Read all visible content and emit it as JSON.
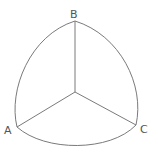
{
  "diagram": {
    "type": "spherical-triangle",
    "colors": {
      "stroke": "#7a7a7a",
      "label": "#555555",
      "background": "#ffffff"
    },
    "vertices": [
      {
        "id": "A",
        "label": "A",
        "x": 17,
        "y": 127
      },
      {
        "id": "B",
        "label": "B",
        "x": 75,
        "y": 21
      },
      {
        "id": "C",
        "label": "C",
        "x": 136,
        "y": 125
      }
    ],
    "center": {
      "x": 75,
      "y": 92
    },
    "edges": [
      {
        "from": "A",
        "to": "B",
        "style": "arc"
      },
      {
        "from": "B",
        "to": "C",
        "style": "arc"
      },
      {
        "from": "C",
        "to": "A",
        "style": "arc"
      },
      {
        "from": "center",
        "to": "A",
        "style": "line"
      },
      {
        "from": "center",
        "to": "B",
        "style": "line"
      },
      {
        "from": "center",
        "to": "C",
        "style": "line"
      }
    ]
  }
}
